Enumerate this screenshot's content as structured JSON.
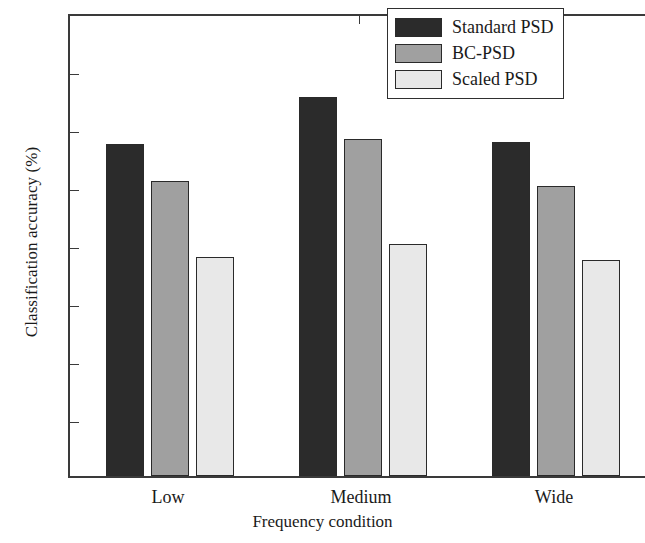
{
  "chart_data": {
    "type": "bar",
    "title": "",
    "xlabel": "Frequency condition",
    "ylabel": "Classification accuracy (%)",
    "categories": [
      "Low",
      "Medium",
      "Wide"
    ],
    "series": [
      {
        "name": "Standard PSD",
        "color": "#2b2b2b",
        "values": [
          57.3,
          65.4,
          57.6
        ]
      },
      {
        "name": "BC-PSD",
        "color": "#a0a0a0",
        "values": [
          50.8,
          58.1,
          50.0
        ]
      },
      {
        "name": "Scaled PSD",
        "color": "#e8e8e8",
        "values": [
          37.8,
          40.0,
          37.2
        ]
      }
    ],
    "ylim": [
      0,
      80
    ],
    "yticks": [
      0,
      10,
      20,
      30,
      40,
      50,
      60,
      70,
      80
    ],
    "ytick_labels": [
      "0",
      "10",
      "20",
      "30",
      "40",
      "50",
      "60",
      "70",
      "80"
    ],
    "grid": false,
    "legend_position": "top-right",
    "axis_color": "#3a3a3a",
    "bar_edge_color": "#2a2a2a"
  }
}
